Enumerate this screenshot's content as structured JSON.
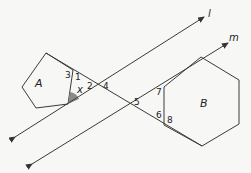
{
  "diagram": {
    "lines": [
      {
        "name": "l",
        "label": "l"
      },
      {
        "name": "m",
        "label": "m"
      }
    ],
    "shapes": [
      {
        "name": "pentagon",
        "label": "A"
      },
      {
        "name": "hexagon",
        "label": "B"
      }
    ],
    "angle_labels": {
      "a1": "1",
      "a2": "2",
      "a3": "3",
      "a4": "4",
      "a5": "5",
      "a6": "6",
      "a7": "7",
      "a8": "8",
      "ax": "x"
    },
    "colors": {
      "stroke": "#3a3a3a",
      "shade": "#8a8a8a",
      "background": "#f7f7f5"
    }
  }
}
